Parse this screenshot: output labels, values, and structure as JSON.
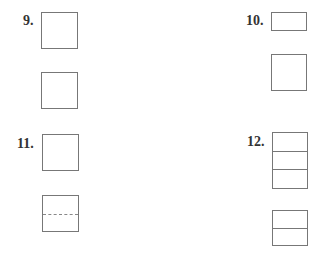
{
  "problems": [
    {
      "number": "9.",
      "label_pos": [
        23,
        14
      ],
      "figures": [
        {
          "x": 41,
          "y": 12,
          "w": 37,
          "h": 37,
          "lines": []
        },
        {
          "x": 41,
          "y": 72,
          "w": 37,
          "h": 37,
          "lines": []
        }
      ]
    },
    {
      "number": "10.",
      "label_pos": [
        246,
        14
      ],
      "figures": [
        {
          "x": 271,
          "y": 12,
          "w": 36,
          "h": 19,
          "lines": []
        },
        {
          "x": 271,
          "y": 54,
          "w": 36,
          "h": 37,
          "lines": []
        }
      ]
    },
    {
      "number": "11.",
      "label_pos": [
        17,
        137
      ],
      "figures": [
        {
          "x": 42,
          "y": 134,
          "w": 37,
          "h": 37,
          "lines": []
        },
        {
          "x": 42,
          "y": 195,
          "w": 37,
          "h": 37,
          "lines": [
            {
              "y": 18,
              "style": "dashed"
            }
          ]
        }
      ]
    },
    {
      "number": "12.",
      "label_pos": [
        247,
        135
      ],
      "figures": [
        {
          "x": 272,
          "y": 132,
          "w": 36,
          "h": 57,
          "lines": [
            {
              "y": 18,
              "style": "solid"
            },
            {
              "y": 36,
              "style": "solid"
            }
          ]
        },
        {
          "x": 272,
          "y": 210,
          "w": 36,
          "h": 36,
          "lines": [
            {
              "y": 17,
              "style": "solid"
            }
          ]
        }
      ]
    }
  ]
}
